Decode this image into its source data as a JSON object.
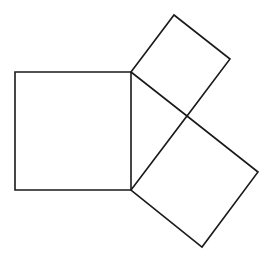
{
  "diagram": {
    "type": "geometry",
    "stroke_color": "#1a1a1a",
    "background": "#ffffff",
    "triangle": {
      "vertices": [
        [
          131,
          72
        ],
        [
          131,
          190
        ],
        [
          187,
          116
        ]
      ],
      "right_angle_at": [
        187,
        116
      ]
    },
    "squares": [
      {
        "name": "hypotenuse-square",
        "side": "left",
        "points": [
          [
            15,
            72
          ],
          [
            131,
            72
          ],
          [
            131,
            190
          ],
          [
            15,
            190
          ]
        ]
      },
      {
        "name": "upper-leg-square",
        "side": "upper-right",
        "points": [
          [
            131,
            72
          ],
          [
            174,
            15
          ],
          [
            230,
            59
          ],
          [
            187,
            116
          ]
        ]
      },
      {
        "name": "lower-leg-square",
        "side": "lower-right",
        "points": [
          [
            131,
            190
          ],
          [
            187,
            116
          ],
          [
            258,
            172
          ],
          [
            202,
            247
          ]
        ]
      }
    ]
  }
}
